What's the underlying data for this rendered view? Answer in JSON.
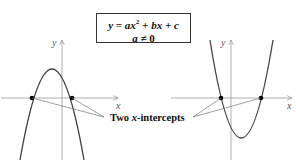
{
  "equation": {
    "line1_prefix": "y = ax",
    "line1_exp": "2",
    "line1_suffix": " + bx + c",
    "line2_var": "a",
    "line2_op": " ≠ ",
    "line2_num": "0"
  },
  "callout": {
    "prefix": "Two ",
    "var": "x",
    "suffix": "-intercepts"
  },
  "graphs": [
    {
      "name": "downward-parabola",
      "opens": "down",
      "x_axis_label": "x",
      "y_axis_label": "y",
      "intercepts": 2
    },
    {
      "name": "upward-parabola",
      "opens": "up",
      "x_axis_label": "x",
      "y_axis_label": "y",
      "intercepts": 2
    }
  ],
  "colors": {
    "curve": "#444444",
    "axis": "#888888",
    "point": "#000000",
    "text": "#111111"
  }
}
